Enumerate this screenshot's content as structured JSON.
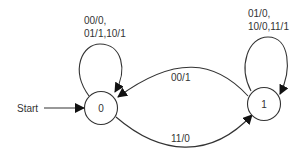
{
  "diagram": {
    "type": "finite-state-machine",
    "start_label": "Start",
    "states": [
      {
        "id": "0",
        "label": "0",
        "start": true
      },
      {
        "id": "1",
        "label": "1",
        "start": false
      }
    ],
    "transitions": [
      {
        "from": "0",
        "to": "0",
        "label_line1": "00/0,",
        "label_line2": "01/1,10/1"
      },
      {
        "from": "1",
        "to": "1",
        "label_line1": "01/0,",
        "label_line2": "10/0,11/1"
      },
      {
        "from": "1",
        "to": "0",
        "label": "00/1"
      },
      {
        "from": "0",
        "to": "1",
        "label": "11/0"
      }
    ],
    "colors": {
      "stroke": "#333333",
      "background": "#ffffff"
    }
  }
}
